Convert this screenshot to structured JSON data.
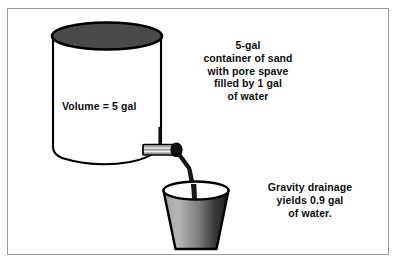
{
  "figure": {
    "background_color": "#ffffff",
    "border_color": "#9a9a9a"
  },
  "labels": {
    "volume": "Volume = 5 gal",
    "container_note": "5-gal\ncontainer of sand\nwith pore spave\nfilled by 1 gal\nof water",
    "drainage_note": "Gravity drainage\nyields 0.9 gal\nof water."
  },
  "objects": {
    "cylinder": {
      "name": "sand container cylinder",
      "top_fill": "#4a4a4a",
      "body_fill": "#ffffff",
      "outline": "#000000"
    },
    "valve": {
      "name": "drain valve spout",
      "body_fill": "#cfcfcf",
      "cap_fill": "#1a1a1a",
      "outline": "#000000"
    },
    "water_stream": {
      "name": "water stream",
      "fill": "#1a1a1a"
    },
    "bucket": {
      "name": "collection bucket",
      "fill_light": "#b5b5b5",
      "fill_dark": "#2b2b2b",
      "rim_fill": "#ffffff",
      "outline": "#000000"
    }
  }
}
